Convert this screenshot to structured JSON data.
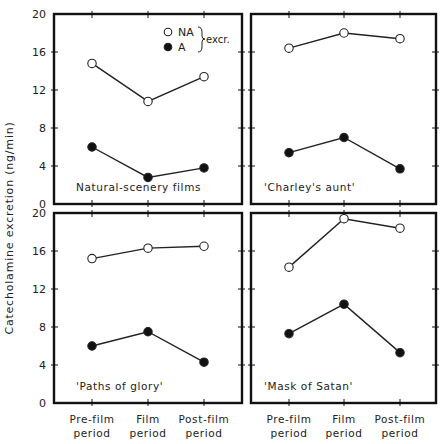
{
  "chart_data": {
    "type": "line",
    "layout": "2x2 small multiples, shared axes",
    "ylabel": "Catecholamine excretion (ng/min)",
    "xlabel": "",
    "categories": [
      "Pre-film period",
      "Film period",
      "Post-film period"
    ],
    "category_lines": [
      [
        "Pre-film",
        "period"
      ],
      [
        "Film",
        "period"
      ],
      [
        "Post-film",
        "period"
      ]
    ],
    "ylim": [
      0,
      20
    ],
    "yticks": [
      0,
      4,
      8,
      12,
      16,
      20
    ],
    "grid": false,
    "legend": {
      "position": "top-left panel, upper right",
      "entries": [
        {
          "name": "NA",
          "marker": "open-circle"
        },
        {
          "name": "A",
          "marker": "filled-circle"
        }
      ],
      "group_label": "excr."
    },
    "panels": [
      {
        "title": "Natural-scenery films",
        "position": "top-left",
        "series": [
          {
            "name": "NA",
            "values": [
              14.8,
              10.8,
              13.4
            ]
          },
          {
            "name": "A",
            "values": [
              6.0,
              2.8,
              3.8
            ]
          }
        ]
      },
      {
        "title": "'Charley's aunt'",
        "position": "top-right",
        "series": [
          {
            "name": "NA",
            "values": [
              16.4,
              18.0,
              17.4
            ]
          },
          {
            "name": "A",
            "values": [
              5.4,
              7.0,
              3.7
            ]
          }
        ]
      },
      {
        "title": "'Paths of glory'",
        "position": "bottom-left",
        "series": [
          {
            "name": "NA",
            "values": [
              15.2,
              16.3,
              16.5
            ]
          },
          {
            "name": "A",
            "values": [
              6.0,
              7.5,
              4.3
            ]
          }
        ]
      },
      {
        "title": "'Mask of Satan'",
        "position": "bottom-right",
        "series": [
          {
            "name": "NA",
            "values": [
              14.3,
              19.4,
              18.4
            ]
          },
          {
            "name": "A",
            "values": [
              7.3,
              10.4,
              5.3
            ]
          }
        ]
      }
    ]
  },
  "colors": {
    "axis": "#111111",
    "line": "#222222",
    "marker_fill_A": "#111111",
    "marker_fill_NA": "#ffffff",
    "background": "#ffffff"
  }
}
